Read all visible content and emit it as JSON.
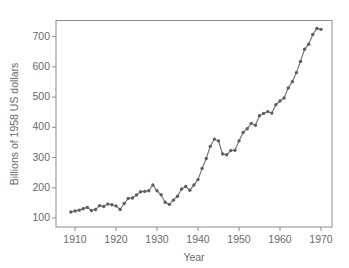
{
  "chart_data": {
    "type": "line",
    "title": "",
    "xlabel": "Year",
    "ylabel": "Billions of 1958 US dollars",
    "xlim": [
      1906,
      1974
    ],
    "ylim": [
      85,
      760
    ],
    "xticks": [
      1910,
      1920,
      1930,
      1940,
      1950,
      1960,
      1970
    ],
    "yticks": [
      100,
      200,
      300,
      400,
      500,
      600,
      700
    ],
    "grid": false,
    "legend": null,
    "marker": "circle",
    "line_color": "#6e6e6e",
    "marker_color": "#5e5e5e",
    "series": [
      {
        "name": "US GNP",
        "x": [
          1909,
          1910,
          1911,
          1912,
          1913,
          1914,
          1915,
          1916,
          1917,
          1918,
          1919,
          1920,
          1921,
          1922,
          1923,
          1924,
          1925,
          1926,
          1927,
          1928,
          1929,
          1930,
          1931,
          1932,
          1933,
          1934,
          1935,
          1936,
          1937,
          1938,
          1939,
          1940,
          1941,
          1942,
          1943,
          1944,
          1945,
          1946,
          1947,
          1948,
          1949,
          1950,
          1951,
          1952,
          1953,
          1954,
          1955,
          1956,
          1957,
          1958,
          1959,
          1960,
          1961,
          1962,
          1963,
          1964,
          1965,
          1966,
          1967,
          1968,
          1969,
          1970
        ],
        "values": [
          120,
          123,
          126,
          131,
          135,
          125,
          128,
          141,
          138,
          146,
          144,
          140,
          128,
          148,
          165,
          166,
          176,
          187,
          188,
          190,
          209,
          190,
          177,
          152,
          145,
          159,
          172,
          196,
          204,
          192,
          209,
          227,
          264,
          297,
          337,
          361,
          355,
          312,
          309,
          323,
          324,
          355,
          383,
          395,
          413,
          407,
          438,
          446,
          452,
          447,
          475,
          487,
          497,
          530,
          551,
          581,
          618,
          658,
          675,
          707,
          727,
          724
        ]
      }
    ]
  },
  "axis": {
    "ytick_labels": [
      "700",
      "600",
      "500",
      "400",
      "300",
      "200",
      "100"
    ],
    "xtick_labels": [
      "1910",
      "1920",
      "1930",
      "1940",
      "1950",
      "1960",
      "1970"
    ],
    "xlabel": "Year",
    "ylabel": "Billions of 1958 US dollars"
  }
}
